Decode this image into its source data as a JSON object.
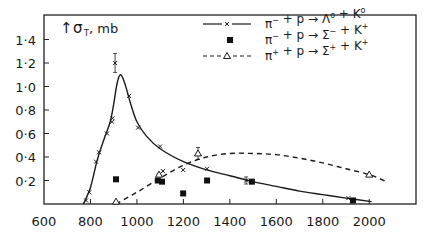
{
  "chart_data": {
    "type": "line",
    "title": "",
    "xlabel": "",
    "ylabel": "σT, mb",
    "xlim": [
      600,
      2200
    ],
    "ylim": [
      0,
      1.61
    ],
    "x_ticks": [
      600,
      800,
      1000,
      1200,
      1400,
      1600,
      1800,
      2000
    ],
    "y_ticks": [
      0.2,
      0.4,
      0.6,
      0.8,
      1.0,
      1.2,
      1.4
    ],
    "y_tick_labels": [
      "0·2",
      "0·4",
      "0·6",
      "0·8",
      "1·0",
      "1·2",
      "1·4"
    ],
    "grid": false,
    "legend_position": "upper right",
    "series": [
      {
        "name": "π⁻ + p → Λ° + K°",
        "marker": "x",
        "line": "solid",
        "points": [
          {
            "x": 781,
            "y": 0.03
          },
          {
            "x": 795,
            "y": 0.1
          },
          {
            "x": 824,
            "y": 0.36
          },
          {
            "x": 837,
            "y": 0.44
          },
          {
            "x": 871,
            "y": 0.6
          },
          {
            "x": 893,
            "y": 0.7
          },
          {
            "x": 895,
            "y": 0.73
          },
          {
            "x": 906,
            "y": 1.2,
            "err": 0.08
          },
          {
            "x": 966,
            "y": 0.92
          },
          {
            "x": 1005,
            "y": 0.65
          },
          {
            "x": 1100,
            "y": 0.49
          },
          {
            "x": 1112,
            "y": 0.28
          },
          {
            "x": 1199,
            "y": 0.29
          },
          {
            "x": 1302,
            "y": 0.3
          },
          {
            "x": 1470,
            "y": 0.2,
            "err": 0.03
          },
          {
            "x": 1910,
            "y": 0.05
          }
        ],
        "curve": [
          [
            770,
            0.0
          ],
          [
            800,
            0.14
          ],
          [
            830,
            0.38
          ],
          [
            860,
            0.56
          ],
          [
            885,
            0.7
          ],
          [
            900,
            0.85
          ],
          [
            912,
            1.0
          ],
          [
            922,
            1.08
          ],
          [
            930,
            1.1
          ],
          [
            940,
            1.07
          ],
          [
            955,
            0.98
          ],
          [
            975,
            0.84
          ],
          [
            1000,
            0.7
          ],
          [
            1040,
            0.58
          ],
          [
            1100,
            0.47
          ],
          [
            1200,
            0.36
          ],
          [
            1300,
            0.29
          ],
          [
            1400,
            0.24
          ],
          [
            1500,
            0.19
          ],
          [
            1600,
            0.15
          ],
          [
            1700,
            0.11
          ],
          [
            1800,
            0.08
          ],
          [
            1900,
            0.05
          ],
          [
            2010,
            0.02
          ]
        ]
      },
      {
        "name": "π⁻ + p → Σ⁻ + K⁺",
        "marker": "square",
        "line": "none",
        "points": [
          {
            "x": 910,
            "y": 0.21
          },
          {
            "x": 1090,
            "y": 0.2
          },
          {
            "x": 1108,
            "y": 0.19
          },
          {
            "x": 1199,
            "y": 0.09
          },
          {
            "x": 1302,
            "y": 0.2
          },
          {
            "x": 1495,
            "y": 0.19
          },
          {
            "x": 1930,
            "y": 0.03
          }
        ]
      },
      {
        "name": "π⁺ + p → Σ⁺ + K⁺",
        "marker": "triangle",
        "line": "dashed",
        "points": [
          {
            "x": 910,
            "y": 0.02
          },
          {
            "x": 1095,
            "y": 0.25
          },
          {
            "x": 1263,
            "y": 0.43,
            "err": 0.05
          },
          {
            "x": 2000,
            "y": 0.25
          }
        ],
        "curve": [
          [
            910,
            0.0
          ],
          [
            1000,
            0.1
          ],
          [
            1100,
            0.22
          ],
          [
            1200,
            0.33
          ],
          [
            1300,
            0.4
          ],
          [
            1400,
            0.43
          ],
          [
            1500,
            0.43
          ],
          [
            1600,
            0.42
          ],
          [
            1700,
            0.39
          ],
          [
            1800,
            0.35
          ],
          [
            1900,
            0.3
          ],
          [
            2000,
            0.25
          ],
          [
            2075,
            0.19
          ]
        ]
      }
    ]
  },
  "legend": {
    "items": [
      {
        "prefix": "π",
        "sup1": "−",
        "mid": " + p → ",
        "sym": "Λ",
        "sup2": "o",
        "tail": " + K",
        "sup3": "o"
      },
      {
        "prefix": "π",
        "sup1": "−",
        "mid": " + p → ",
        "sym": "Σ",
        "sup2": "−",
        "tail": " + K",
        "sup3": "+"
      },
      {
        "prefix": "π",
        "sup1": "+",
        "mid": " + p → ",
        "sym": "Σ",
        "sup2": "+",
        "tail": " + K",
        "sup3": "+"
      }
    ]
  },
  "axis": {
    "y_label_main": "σ",
    "y_label_sub": "T",
    "y_label_unit": ", mb",
    "arrow": "↑"
  }
}
